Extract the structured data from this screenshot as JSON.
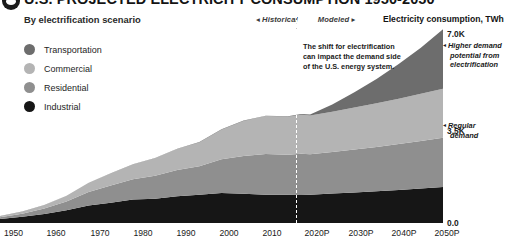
{
  "header": {
    "logo_icon": "circle-eye-logo",
    "title": "U.S. PROJECTED ELECTRICITY CONSUMPTION 1950-2050",
    "subtitle": "By electrification scenario",
    "historical_label": "◂ Historical",
    "modeled_label": "Modeled ▸",
    "value_axis_label": "Electricity consumption, TWh"
  },
  "legend": {
    "items": [
      {
        "label": "Transportation",
        "color": "#6d6d6d"
      },
      {
        "label": "Commercial",
        "color": "#b4b4b4"
      },
      {
        "label": "Residential",
        "color": "#8f8f8f"
      },
      {
        "label": "Industrial",
        "color": "#161616"
      }
    ]
  },
  "annotation": {
    "text": "The shift for electrification can impact the demand side of the U.S. energy system."
  },
  "callouts": [
    {
      "name": "higher-demand",
      "arrow": "◂",
      "line1": "Higher demand",
      "line2": "potential from",
      "line3": "electrification"
    },
    {
      "name": "regular-demand",
      "arrow": "◂",
      "line1": "Regular",
      "line2": "demand",
      "line3": ""
    }
  ],
  "chart_data": {
    "type": "area",
    "title": "U.S. PROJECTED ELECTRICITY CONSUMPTION 1950-2050",
    "subtitle": "By electrification scenario",
    "xlabel": "",
    "ylabel": "Electricity consumption, TWh",
    "ylim": [
      0,
      7000
    ],
    "yticks": [
      0,
      3500,
      7000
    ],
    "ytick_labels": [
      "0.0",
      "3.5K",
      "7.0K"
    ],
    "grid": false,
    "legend_position": "top-left",
    "stacked": true,
    "divider_year": 2018,
    "divider_label": "Historical / Modeled",
    "x": [
      1950,
      1955,
      1960,
      1965,
      1970,
      1975,
      1980,
      1985,
      1990,
      1995,
      2000,
      2005,
      2010,
      2015,
      2018,
      2020,
      2025,
      2030,
      2035,
      2040,
      2045,
      2050
    ],
    "xtick_labels": [
      "1950",
      "1960",
      "1970",
      "1980",
      "1990",
      "2000",
      "2010",
      "2020P",
      "2030P",
      "2040P",
      "2050P"
    ],
    "series": [
      {
        "name": "Industrial",
        "color": "#161616",
        "values": [
          140,
          220,
          320,
          450,
          620,
          720,
          830,
          860,
          950,
          1000,
          1060,
          1030,
          1000,
          1000,
          1010,
          1000,
          1040,
          1080,
          1120,
          1170,
          1220,
          1270
        ]
      },
      {
        "name": "Residential",
        "color": "#8f8f8f",
        "values": [
          60,
          110,
          190,
          310,
          480,
          610,
          720,
          810,
          920,
          1010,
          1190,
          1340,
          1440,
          1410,
          1440,
          1430,
          1470,
          1520,
          1570,
          1620,
          1680,
          1740
        ]
      },
      {
        "name": "Commercial",
        "color": "#b4b4b4",
        "values": [
          40,
          70,
          120,
          200,
          320,
          420,
          520,
          620,
          750,
          840,
          1050,
          1240,
          1340,
          1350,
          1380,
          1370,
          1420,
          1480,
          1540,
          1600,
          1670,
          1740
        ]
      },
      {
        "name": "Transportation",
        "color": "#6d6d6d",
        "values": [
          5,
          5,
          6,
          6,
          7,
          7,
          8,
          8,
          9,
          10,
          12,
          14,
          16,
          18,
          20,
          40,
          260,
          540,
          860,
          1230,
          1630,
          2100
        ]
      }
    ]
  }
}
